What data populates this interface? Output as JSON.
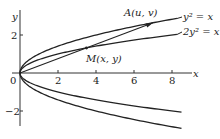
{
  "figure": {
    "axes": {
      "x_label": "x",
      "y_label": "y",
      "x_ticks": [
        {
          "value": 0,
          "label": "0"
        },
        {
          "value": 2,
          "label": "2"
        },
        {
          "value": 4,
          "label": "4"
        },
        {
          "value": 6,
          "label": "6"
        },
        {
          "value": 8,
          "label": "8"
        }
      ],
      "y_ticks": [
        {
          "value": 2,
          "label": "2"
        },
        {
          "value": -2,
          "label": "−2"
        }
      ]
    },
    "curves": [
      {
        "name": "parabola-y2-eq-x",
        "equation_label": "y² = x",
        "a": 1
      },
      {
        "name": "parabola-2y2-eq-x",
        "equation_label": "2y² = x",
        "a": 2
      }
    ],
    "points": {
      "A": {
        "label": "A(u, v)",
        "x": 7.0,
        "y": 2.65
      },
      "M": {
        "label": "M(x, y)",
        "x": 3.5,
        "y": 1.32
      }
    },
    "colors": {
      "stroke": "#222222",
      "background": "#ffffff"
    }
  }
}
